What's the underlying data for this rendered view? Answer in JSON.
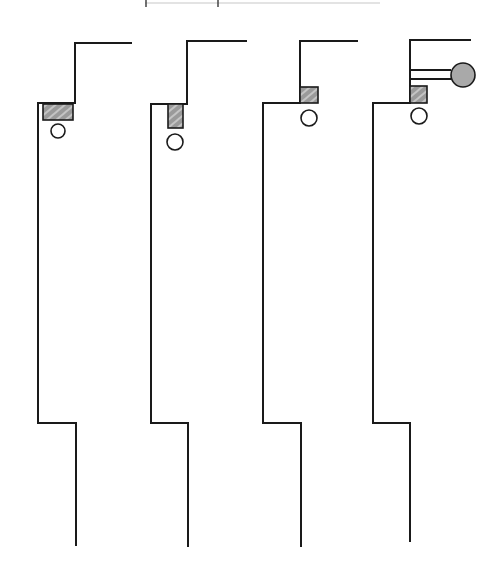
{
  "diagram": {
    "colors": {
      "line": "#1a1a1a",
      "block_fill": "#9a9a9a",
      "block_hatch": "#d6d6d6",
      "ball_fill": "#a9a9a9",
      "background": "#ffffff"
    },
    "figures": [
      {
        "id": 1,
        "upper_wall_x": 75,
        "top_y": 43,
        "top_end_x": 131,
        "step_y": 103,
        "mid_wall_x": 38,
        "lower_step_y": 423,
        "lower_wall_x": 76,
        "bottom_y": 545,
        "block": {
          "x": 43,
          "y": 104,
          "w": 30,
          "h": 16
        },
        "circle": {
          "cx": 58,
          "cy": 131,
          "r": 7
        },
        "ball": null
      },
      {
        "id": 2,
        "upper_wall_x": 187,
        "top_y": 41,
        "top_end_x": 246,
        "step_y": 104,
        "mid_wall_x": 151,
        "lower_step_y": 423,
        "lower_wall_x": 188,
        "bottom_y": 546,
        "block": {
          "x": 168,
          "y": 104,
          "w": 15,
          "h": 24
        },
        "circle": {
          "cx": 175,
          "cy": 142,
          "r": 8
        },
        "ball": null
      },
      {
        "id": 3,
        "upper_wall_x": 300,
        "top_y": 41,
        "top_end_x": 357,
        "step_y": 103,
        "mid_wall_x": 263,
        "lower_step_y": 423,
        "lower_wall_x": 301,
        "bottom_y": 546,
        "block": {
          "x": 300,
          "y": 87,
          "w": 18,
          "h": 16
        },
        "circle": {
          "cx": 309,
          "cy": 118,
          "r": 8
        },
        "ball": null
      },
      {
        "id": 4,
        "upper_wall_x": 410,
        "top_y": 40,
        "top_end_x": 470,
        "step_y": 103,
        "mid_wall_x": 373,
        "lower_step_y": 423,
        "lower_wall_x": 410,
        "bottom_y": 541,
        "block": {
          "x": 410,
          "y": 86,
          "w": 17,
          "h": 17
        },
        "circle": {
          "cx": 419,
          "cy": 116,
          "r": 8
        },
        "ball": {
          "cx": 463,
          "cy": 75,
          "r": 12,
          "rod_y1": 70,
          "rod_y2": 79,
          "rod_x_start": 410,
          "rod_x_end": 451
        }
      }
    ],
    "crop_artifact": {
      "y": 3,
      "x1": 145,
      "x2": 380,
      "ticks": [
        146,
        218
      ]
    }
  }
}
